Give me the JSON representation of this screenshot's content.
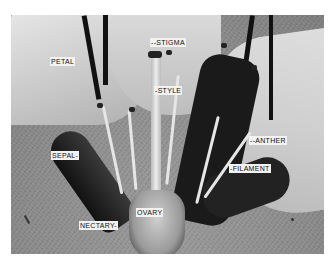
{
  "figure": {
    "labels": {
      "petal": "PETAL",
      "stigma": "--STIGMA",
      "style": "-STYLE",
      "anther": "--ANTHER",
      "filament": "-FILAMENT",
      "sepal": "SEPAL-",
      "ovary": "OVARY",
      "nectary": "NECTARY-"
    }
  }
}
